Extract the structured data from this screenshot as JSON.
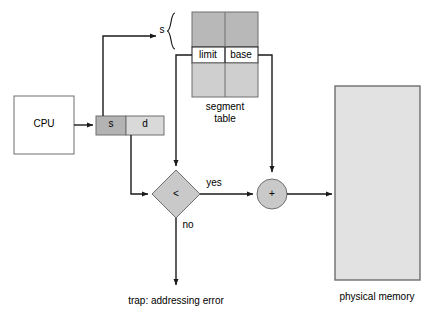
{
  "diagram": {
    "colors": {
      "line": "#1a1a1a",
      "text": "#000000",
      "cpu_fill": "#ffffff",
      "s_field_fill": "#b3b3b3",
      "d_field_fill": "#d9d9d9",
      "table_upper_fill": "#b8b8b8",
      "table_lower_fill": "#cfcfcf",
      "table_row_fill": "#ffffff",
      "diamond_fill": "#c9c9c9",
      "adder_fill": "#c9c9c9",
      "memory_fill": "#e2e2e2",
      "border": "#6e6e6e"
    },
    "cpu": {
      "label": "CPU"
    },
    "logical_address": {
      "segment_field": "s",
      "offset_field": "d"
    },
    "segment_table": {
      "index_label": "s",
      "limit_label": "limit",
      "base_label": "base",
      "caption_line1": "segment",
      "caption_line2": "table"
    },
    "comparator": {
      "operator": "<",
      "yes_label": "yes",
      "no_label": "no"
    },
    "adder": {
      "operator": "+"
    },
    "trap": {
      "label": "trap: addressing error"
    },
    "physical_memory": {
      "caption": "physical memory"
    }
  }
}
